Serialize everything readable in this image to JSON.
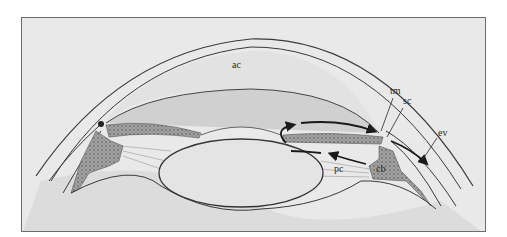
{
  "figure": {
    "labels": {
      "ac": "ac",
      "tm": "tm",
      "sc": "sc",
      "ev": "ev",
      "pc": "pc",
      "cb": "cb"
    },
    "colors": {
      "background": "#e9e9e9",
      "frame": "#6d6d6d",
      "line": "#3a3a3a",
      "tissue": "#9a9a9a",
      "arrow": "#1a1a1a"
    }
  }
}
